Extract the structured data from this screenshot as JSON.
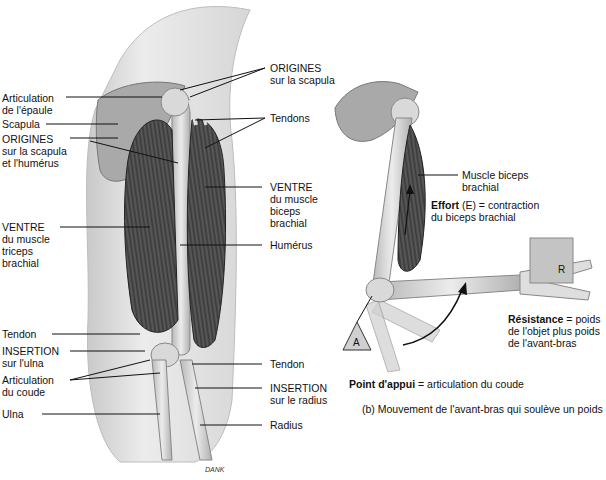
{
  "figure": {
    "signature": "DANK",
    "colors": {
      "skin": "#e4e4e4",
      "skin_shadow": "#c8c8c8",
      "muscle": "#4a4a4a",
      "muscle_dark": "#2e2e2e",
      "bone": "#c9c9c9",
      "bone_light": "#e8e8e8",
      "weight_box": "#c4c4c4",
      "leader_line": "#111111"
    }
  },
  "panel_a": {
    "left_labels": [
      {
        "lines": [
          "Articulation",
          "de l'épaule"
        ]
      },
      {
        "lines": [
          "Scapula"
        ]
      },
      {
        "lines": [
          "ORIGINES",
          "sur la scapula",
          "et l'humérus"
        ]
      },
      {
        "lines": [
          "VENTRE",
          "du muscle",
          "triceps",
          "brachial"
        ]
      },
      {
        "lines": [
          "Tendon"
        ]
      },
      {
        "lines": [
          "INSERTION",
          "sur l'ulna"
        ]
      },
      {
        "lines": [
          "Articulation",
          "du coude"
        ]
      },
      {
        "lines": [
          "Ulna"
        ]
      }
    ],
    "right_labels": [
      {
        "lines": [
          "ORIGINES",
          "sur la scapula"
        ]
      },
      {
        "lines": [
          "Tendons"
        ]
      },
      {
        "lines": [
          "VENTRE",
          "du muscle",
          "biceps",
          "brachial"
        ]
      },
      {
        "lines": [
          "Humérus"
        ]
      },
      {
        "lines": [
          "Tendon"
        ]
      },
      {
        "lines": [
          "INSERTION",
          "sur le radius"
        ]
      },
      {
        "lines": [
          "Radius"
        ]
      }
    ]
  },
  "panel_b": {
    "muscle_label": [
      "Muscle biceps",
      "brachial"
    ],
    "effort": {
      "bold": "Effort",
      "rest1": " (E) = contraction",
      "line2": "du biceps brachial"
    },
    "resistance": {
      "bold": "Résistance",
      "rest1": " = poids",
      "line2": "de l'objet plus poids",
      "line3": "de l'avant-bras"
    },
    "fulcrum": {
      "bold": "Point d'appui",
      "rest": " = articulation du coude"
    },
    "caption": "(b) Mouvement de l'avant-bras qui soulève un poids",
    "marker_A": "A",
    "marker_R": "R"
  }
}
